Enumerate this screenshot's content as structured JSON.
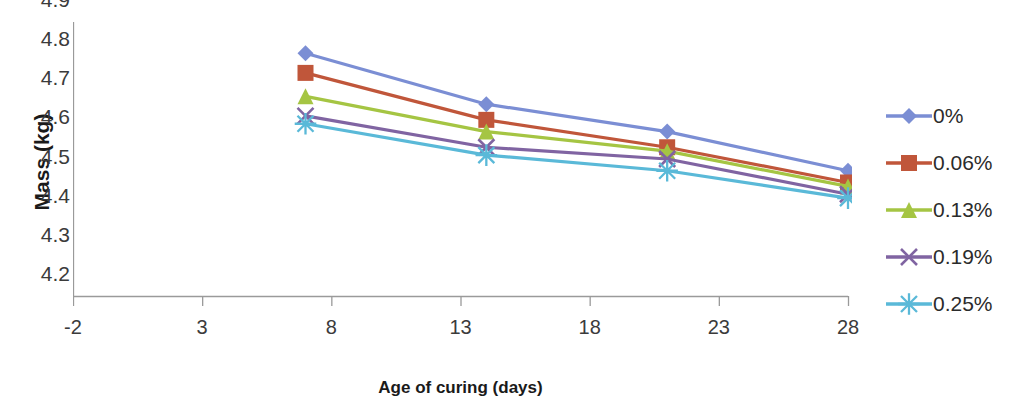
{
  "chart_data": {
    "type": "line",
    "title": "",
    "xlabel": "Age of curing (days)",
    "ylabel": "Mass (kg)",
    "x": [
      7,
      14,
      21,
      28
    ],
    "xlim": [
      -2,
      28
    ],
    "ylim": [
      4.2,
      4.9
    ],
    "xticks": [
      -2,
      3,
      8,
      13,
      18,
      23,
      28
    ],
    "yticks": [
      4.2,
      4.3,
      4.4,
      4.5,
      4.6,
      4.7,
      4.8,
      4.9
    ],
    "xtick_labels": [
      "-2",
      "3",
      "8",
      "13",
      "18",
      "23",
      "28"
    ],
    "ytick_labels": [
      "4.2",
      "4.3",
      "4.4",
      "4.5",
      "4.6",
      "4.7",
      "4.8",
      "4.9"
    ],
    "grid": false,
    "legend_position": "right",
    "series": [
      {
        "name": "0%",
        "color": "#7b8ed4",
        "marker": "diamond",
        "values": [
          4.82,
          4.69,
          4.62,
          4.52
        ]
      },
      {
        "name": "0.06%",
        "color": "#c0563a",
        "marker": "square",
        "values": [
          4.77,
          4.65,
          4.58,
          4.49
        ]
      },
      {
        "name": "0.13%",
        "color": "#a5c543",
        "marker": "triangle",
        "values": [
          4.71,
          4.62,
          4.57,
          4.48
        ]
      },
      {
        "name": "0.19%",
        "color": "#8064a2",
        "marker": "x",
        "values": [
          4.66,
          4.58,
          4.55,
          4.46
        ]
      },
      {
        "name": "0.25%",
        "color": "#5ab9d8",
        "marker": "star",
        "values": [
          4.64,
          4.56,
          4.52,
          4.45
        ]
      }
    ]
  },
  "legend": {
    "items": [
      {
        "label": "0%"
      },
      {
        "label": "0.06%"
      },
      {
        "label": "0.13%"
      },
      {
        "label": "0.19%"
      },
      {
        "label": "0.25%"
      }
    ]
  }
}
